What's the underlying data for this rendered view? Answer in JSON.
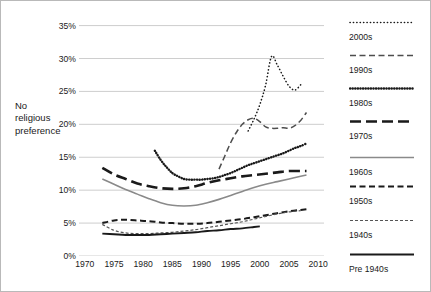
{
  "axis_caption": "No\nreligious\npreference",
  "chart_data": {
    "type": "line",
    "title": "",
    "xlabel": "",
    "ylabel": "No religious preference",
    "xlim": [
      1969,
      2011
    ],
    "ylim": [
      0,
      36
    ],
    "grid": true,
    "legend_position": "right",
    "y_ticks": [
      "0%",
      "5%",
      "10%",
      "15%",
      "20%",
      "25%",
      "30%",
      "35%"
    ],
    "y_tick_values": [
      0,
      5,
      10,
      15,
      20,
      25,
      30,
      35
    ],
    "x_ticks": [
      "1970",
      "1975",
      "1980",
      "1985",
      "1990",
      "1995",
      "2000",
      "2005",
      "2010"
    ],
    "x_tick_values": [
      1970,
      1975,
      1980,
      1985,
      1990,
      1995,
      2000,
      2005,
      2010
    ],
    "series": [
      {
        "name": "2000s",
        "style": "fine-dotted",
        "color": "#1a1a1a",
        "x": [
          1998,
          1999,
          2000,
          2001,
          2002,
          2003,
          2004,
          2005,
          2006,
          2007
        ],
        "values": [
          19.0,
          20.8,
          23.0,
          26.0,
          30.3,
          29.0,
          27.3,
          25.8,
          25.2,
          26.0
        ]
      },
      {
        "name": "1990s",
        "style": "long-dashed-thin",
        "color": "#4d4d4d",
        "x": [
          1993,
          1994,
          1995,
          1996,
          1997,
          1998,
          1999,
          2000,
          2001,
          2002,
          2003,
          2004,
          2005,
          2006,
          2007,
          2008
        ],
        "values": [
          13.2,
          15.2,
          17.2,
          18.8,
          20.0,
          20.7,
          20.9,
          20.4,
          19.6,
          19.4,
          19.4,
          19.5,
          19.4,
          19.8,
          20.6,
          21.8
        ]
      },
      {
        "name": "1980s",
        "style": "dotted-bold",
        "color": "#1a1a1a",
        "x": [
          1982,
          1983,
          1984,
          1985,
          1986,
          1987,
          1988,
          1989,
          1990,
          1991,
          1992,
          1993,
          1994,
          1995,
          1996,
          1997,
          1998,
          1999,
          2000,
          2001,
          2002,
          2003,
          2004,
          2005,
          2006,
          2007,
          2008
        ],
        "values": [
          16.0,
          14.6,
          13.5,
          12.6,
          12.1,
          11.7,
          11.6,
          11.6,
          11.6,
          11.7,
          11.8,
          12.0,
          12.3,
          12.6,
          13.0,
          13.4,
          13.8,
          14.1,
          14.4,
          14.7,
          15.0,
          15.3,
          15.6,
          16.0,
          16.4,
          16.7,
          17.1
        ]
      },
      {
        "name": "1970s",
        "style": "long-dashed-bold",
        "color": "#1a1a1a",
        "x": [
          1973,
          1975,
          1977,
          1979,
          1981,
          1983,
          1985,
          1987,
          1989,
          1991,
          1993,
          1995,
          1997,
          1999,
          2001,
          2003,
          2005,
          2007,
          2008
        ],
        "values": [
          13.4,
          12.4,
          11.7,
          11.0,
          10.6,
          10.3,
          10.2,
          10.3,
          10.6,
          11.1,
          11.5,
          11.8,
          12.1,
          12.3,
          12.5,
          12.7,
          12.9,
          12.9,
          12.9
        ]
      },
      {
        "name": "1960s",
        "style": "solid-gray",
        "color": "#8a8a8a",
        "x": [
          1973,
          1975,
          1977,
          1979,
          1981,
          1983,
          1985,
          1987,
          1989,
          1991,
          1993,
          1995,
          1997,
          1999,
          2001,
          2003,
          2005,
          2007,
          2008
        ],
        "values": [
          11.7,
          10.9,
          10.1,
          9.4,
          8.7,
          8.1,
          7.7,
          7.6,
          7.7,
          8.1,
          8.6,
          9.2,
          9.8,
          10.4,
          10.9,
          11.3,
          11.7,
          12.1,
          12.3
        ]
      },
      {
        "name": "1950s",
        "style": "dashed-medium",
        "color": "#1a1a1a",
        "x": [
          1973,
          1975,
          1977,
          1979,
          1981,
          1983,
          1985,
          1987,
          1989,
          1991,
          1993,
          1995,
          1997,
          1999,
          2001,
          2003,
          2005,
          2007,
          2008
        ],
        "values": [
          5.0,
          5.4,
          5.5,
          5.4,
          5.3,
          5.1,
          5.0,
          4.9,
          4.9,
          5.0,
          5.2,
          5.4,
          5.6,
          5.9,
          6.2,
          6.5,
          6.8,
          7.0,
          7.1
        ]
      },
      {
        "name": "1940s",
        "style": "fine-dashed",
        "color": "#555555",
        "x": [
          1973,
          1975,
          1977,
          1979,
          1981,
          1983,
          1985,
          1987,
          1989,
          1991,
          1993,
          1995,
          1997,
          1999,
          2001,
          2003,
          2005,
          2007
        ],
        "values": [
          4.8,
          3.9,
          3.5,
          3.4,
          3.4,
          3.5,
          3.6,
          3.8,
          4.0,
          4.3,
          4.6,
          4.9,
          5.2,
          5.6,
          6.0,
          6.4,
          6.7,
          6.9
        ]
      },
      {
        "name": "Pre 1940s",
        "style": "solid-bold",
        "color": "#1a1a1a",
        "x": [
          1973,
          1975,
          1977,
          1979,
          1981,
          1983,
          1985,
          1987,
          1989,
          1991,
          1993,
          1995,
          1997,
          1999,
          2000
        ],
        "values": [
          3.4,
          3.3,
          3.2,
          3.2,
          3.2,
          3.3,
          3.4,
          3.5,
          3.6,
          3.8,
          3.9,
          4.1,
          4.2,
          4.4,
          4.5
        ]
      }
    ]
  },
  "legend": {
    "items": [
      {
        "label": "2000s",
        "style": "fine-dotted"
      },
      {
        "label": "1990s",
        "style": "long-dashed-thin"
      },
      {
        "label": "1980s",
        "style": "dotted-bold"
      },
      {
        "label": "1970s",
        "style": "long-dashed-bold"
      },
      {
        "label": "1960s",
        "style": "solid-gray"
      },
      {
        "label": "1950s",
        "style": "dashed-medium"
      },
      {
        "label": "1940s",
        "style": "fine-dashed"
      },
      {
        "label": "Pre 1940s",
        "style": "solid-bold"
      }
    ]
  }
}
